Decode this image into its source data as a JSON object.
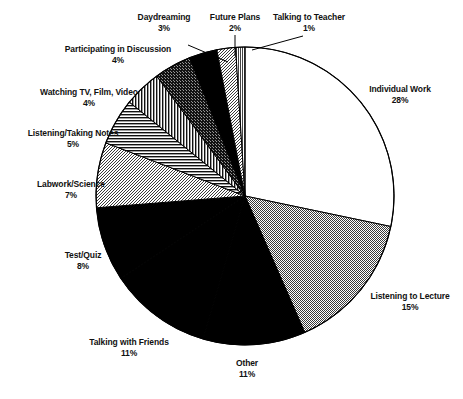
{
  "chart_data": {
    "type": "pie",
    "title": "",
    "subtitle": "",
    "xlabel": "",
    "ylabel": "",
    "legend_position": "none",
    "grid": false,
    "start_angle_deg": 0,
    "direction": "clockwise",
    "units": "percent",
    "total": 100,
    "categories": [
      "Individual Work",
      "Listening to Lecture",
      "Other",
      "Talking with Friends",
      "Test/Quiz",
      "Labwork/Science",
      "Listening/Taking Notes",
      "Watching TV, Film, Video",
      "Participating in Discussion",
      "Daydreaming",
      "Future Plans",
      "Talking to Teacher"
    ],
    "values": [
      28,
      15,
      11,
      11,
      8,
      7,
      5,
      4,
      4,
      3,
      2,
      1
    ],
    "slices": [
      {
        "label": "Individual Work",
        "value": 28,
        "percent_text": "28%",
        "fill": "white",
        "color": "#ffffff"
      },
      {
        "label": "Listening to Lecture",
        "value": 15,
        "percent_text": "15%",
        "fill": "checker",
        "color": "#9a9a9a"
      },
      {
        "label": "Other",
        "value": 11,
        "percent_text": "11%",
        "fill": "solid-black",
        "color": "#000000"
      },
      {
        "label": "Talking with Friends",
        "value": 11,
        "percent_text": "11%",
        "fill": "solid-black",
        "color": "#000000"
      },
      {
        "label": "Test/Quiz",
        "value": 8,
        "percent_text": "8%",
        "fill": "solid-black",
        "color": "#000000"
      },
      {
        "label": "Labwork/Science",
        "value": 7,
        "percent_text": "7%",
        "fill": "light-gray",
        "color": "#c9c9c9"
      },
      {
        "label": "Listening/Taking Notes",
        "value": 5,
        "percent_text": "5%",
        "fill": "horizontal-lines",
        "color": "#555555"
      },
      {
        "label": "Watching TV, Film, Video",
        "value": 4,
        "percent_text": "4%",
        "fill": "vertical-lines",
        "color": "#555555"
      },
      {
        "label": "Participating in Discussion",
        "value": 4,
        "percent_text": "4%",
        "fill": "dark-speckle",
        "color": "#2a2a2a"
      },
      {
        "label": "Daydreaming",
        "value": 3,
        "percent_text": "3%",
        "fill": "solid-black",
        "color": "#000000"
      },
      {
        "label": "Future Plans",
        "value": 2,
        "percent_text": "2%",
        "fill": "light-gray",
        "color": "#cccccc"
      },
      {
        "label": "Talking to Teacher",
        "value": 1,
        "percent_text": "1%",
        "fill": "mid-gray",
        "color": "#8d8d8d"
      }
    ]
  },
  "labels": {
    "individual_work": {
      "name": "Individual Work",
      "percent": "28%"
    },
    "listening_lecture": {
      "name": "Listening to Lecture",
      "percent": "15%"
    },
    "other": {
      "name": "Other",
      "percent": "11%"
    },
    "talking_friends": {
      "name": "Talking with Friends",
      "percent": "11%"
    },
    "test_quiz": {
      "name": "Test/Quiz",
      "percent": "8%"
    },
    "labwork_science": {
      "name": "Labwork/Science",
      "percent": "7%"
    },
    "listening_notes": {
      "name": "Listening/Taking Notes",
      "percent": "5%"
    },
    "watching_tv": {
      "name": "Watching TV, Film, Video",
      "percent": "4%"
    },
    "participating": {
      "name": "Participating in Discussion",
      "percent": "4%"
    },
    "daydreaming": {
      "name": "Daydreaming",
      "percent": "3%"
    },
    "future_plans": {
      "name": "Future Plans",
      "percent": "2%"
    },
    "talking_teacher": {
      "name": "Talking to Teacher",
      "percent": "1%"
    }
  },
  "style": {
    "outline_color": "#000000",
    "background": "#ffffff",
    "text_color": "#111111"
  }
}
